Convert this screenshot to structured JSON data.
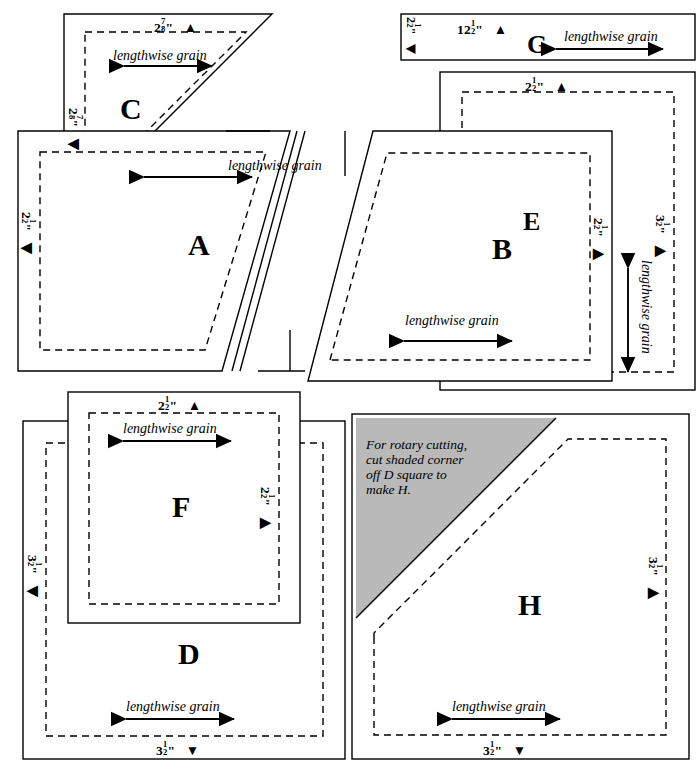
{
  "diagram": {
    "grain_label": "lengthwise grain",
    "note": "For rotary cutting, cut shaded corner off D square to make H.",
    "colors": {
      "line": "#000000",
      "shade": "#b9b9b9",
      "background": "#ffffff"
    },
    "markers": {
      "up": "▲",
      "down": "▼",
      "left": "◀",
      "right": "▶"
    }
  },
  "pieces": [
    {
      "id": "A",
      "label": "A",
      "shape": "parallelogram",
      "grain": "lengthwise grain",
      "dimensions": [
        {
          "name": "left-height",
          "value": "2½\"",
          "whole": "2",
          "num": "1",
          "den": "2",
          "unit": "\"",
          "marker": "◀",
          "orientation": "vertical",
          "side": "left"
        }
      ]
    },
    {
      "id": "B",
      "label": "B",
      "shape": "parallelogram",
      "grain": "lengthwise grain",
      "dimensions": [
        {
          "name": "right-height",
          "value": "2½\"",
          "whole": "2",
          "num": "1",
          "den": "2",
          "unit": "\"",
          "marker": "▶",
          "orientation": "vertical",
          "side": "right"
        }
      ]
    },
    {
      "id": "C",
      "label": "C",
      "shape": "half-square-triangle",
      "grain": "lengthwise grain",
      "dimensions": [
        {
          "name": "top-width",
          "value": "2⅞\"",
          "whole": "2",
          "num": "7",
          "den": "8",
          "unit": "\"",
          "marker": "▲",
          "orientation": "horizontal",
          "side": "top"
        },
        {
          "name": "left-height",
          "value": "2⅞\"",
          "whole": "2",
          "num": "7",
          "den": "8",
          "unit": "\"",
          "marker": "◀",
          "orientation": "vertical",
          "side": "left"
        }
      ]
    },
    {
      "id": "D",
      "label": "D",
      "shape": "square",
      "grain": "lengthwise grain",
      "dimensions": [
        {
          "name": "left-height",
          "value": "3½\"",
          "whole": "3",
          "num": "1",
          "den": "2",
          "unit": "\"",
          "marker": "◀",
          "orientation": "vertical",
          "side": "left"
        },
        {
          "name": "bottom-width",
          "value": "3½\"",
          "whole": "3",
          "num": "1",
          "den": "2",
          "unit": "\"",
          "marker": "▼",
          "orientation": "horizontal",
          "side": "bottom"
        }
      ]
    },
    {
      "id": "E",
      "label": "E",
      "shape": "strip-vertical",
      "grain": "lengthwise grain",
      "dimensions": [
        {
          "name": "top-width",
          "value": "2½\"",
          "whole": "2",
          "num": "1",
          "den": "2",
          "unit": "\"",
          "marker": "▲",
          "orientation": "horizontal",
          "side": "top"
        },
        {
          "name": "right-height",
          "value": "3½\"",
          "whole": "3",
          "num": "1",
          "den": "2",
          "unit": "\"",
          "marker": "▶",
          "orientation": "vertical",
          "side": "right"
        }
      ]
    },
    {
      "id": "F",
      "label": "F",
      "shape": "square",
      "grain": "lengthwise grain",
      "dimensions": [
        {
          "name": "top-width",
          "value": "2½\"",
          "whole": "2",
          "num": "1",
          "den": "2",
          "unit": "\"",
          "marker": "▲",
          "orientation": "horizontal",
          "side": "top"
        },
        {
          "name": "right-height",
          "value": "2½\"",
          "whole": "2",
          "num": "1",
          "den": "2",
          "unit": "\"",
          "marker": "▶",
          "orientation": "vertical",
          "side": "right"
        }
      ]
    },
    {
      "id": "G",
      "label": "G",
      "shape": "strip-horizontal",
      "grain": "lengthwise grain",
      "dimensions": [
        {
          "name": "top-width",
          "value": "12½\"",
          "whole": "12",
          "num": "1",
          "den": "2",
          "unit": "\"",
          "marker": "▲",
          "orientation": "horizontal",
          "side": "top"
        },
        {
          "name": "left-height",
          "value": "2½\"",
          "whole": "2",
          "num": "1",
          "den": "2",
          "unit": "\"",
          "marker": "◀",
          "orientation": "vertical",
          "side": "left"
        }
      ]
    },
    {
      "id": "H",
      "label": "H",
      "shape": "square-with-cut-corner",
      "grain": "lengthwise grain",
      "note": "For rotary cutting, cut shaded corner off D square to make H.",
      "dimensions": [
        {
          "name": "right-height",
          "value": "3½\"",
          "whole": "3",
          "num": "1",
          "den": "2",
          "unit": "\"",
          "marker": "▶",
          "orientation": "vertical",
          "side": "right"
        },
        {
          "name": "bottom-width",
          "value": "3½\"",
          "whole": "3",
          "num": "1",
          "den": "2",
          "unit": "\"",
          "marker": "▼",
          "orientation": "horizontal",
          "side": "bottom"
        }
      ]
    }
  ],
  "note_lines": [
    "For rotary cutting,",
    "cut shaded corner",
    "off D square to",
    "make H."
  ]
}
